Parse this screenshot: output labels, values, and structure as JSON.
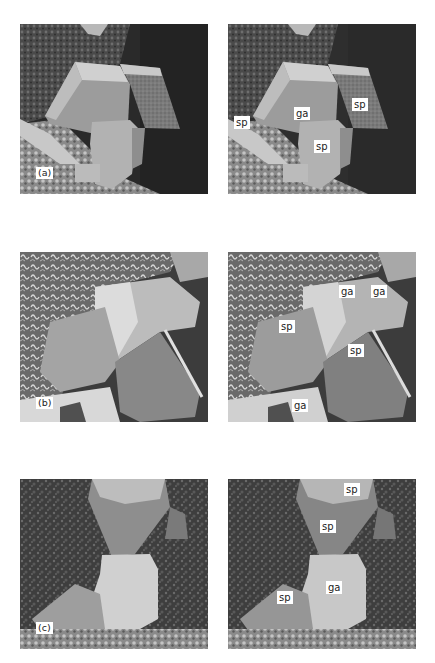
{
  "figure": {
    "rows": [
      {
        "id": "a",
        "panel_label": "(a)",
        "left_image": {
          "description": "SEM micrograph of galena and sphalerite crystal cluster, unlabeled"
        },
        "right_image": {
          "description": "Same SEM micrograph with mineral phase labels",
          "labels": [
            {
              "text": "sp",
              "x": 6,
              "y": 92
            },
            {
              "text": "ga",
              "x": 66,
              "y": 83
            },
            {
              "text": "sp",
              "x": 124,
              "y": 74
            },
            {
              "text": "sp",
              "x": 86,
              "y": 116
            }
          ]
        }
      },
      {
        "id": "b",
        "panel_label": "(b)",
        "left_image": {
          "description": "SEM micrograph of large galena and sphalerite crystals, unlabeled"
        },
        "right_image": {
          "description": "Same SEM micrograph with mineral phase labels",
          "labels": [
            {
              "text": "ga",
              "x": 111,
              "y": 33
            },
            {
              "text": "ga",
              "x": 143,
              "y": 33
            },
            {
              "text": "sp",
              "x": 51,
              "y": 68
            },
            {
              "text": "sp",
              "x": 120,
              "y": 92
            },
            {
              "text": "ga",
              "x": 64,
              "y": 147
            }
          ]
        }
      },
      {
        "id": "c",
        "panel_label": "(c)",
        "left_image": {
          "description": "SEM micrograph of sphalerite and galena crystals on fine-grained matrix, unlabeled"
        },
        "right_image": {
          "description": "Same SEM micrograph with mineral phase labels",
          "labels": [
            {
              "text": "sp",
              "x": 116,
              "y": 4
            },
            {
              "text": "sp",
              "x": 92,
              "y": 41
            },
            {
              "text": "ga",
              "x": 98,
              "y": 102
            },
            {
              "text": "sp",
              "x": 49,
              "y": 112
            }
          ]
        }
      }
    ],
    "legend_terms": {
      "sp": "sphalerite",
      "ga": "galena"
    }
  }
}
